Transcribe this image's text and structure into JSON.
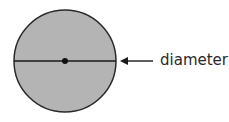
{
  "diagram": {
    "label": "diameter",
    "colors": {
      "fill": "#b4b4b4",
      "stroke": "#2a2a2a",
      "text": "#2a2a2a"
    },
    "circle": {
      "cx": 65,
      "cy": 61,
      "r": 51
    },
    "arrow": {
      "from_x": 153,
      "to_x": 120,
      "y": 61
    }
  }
}
